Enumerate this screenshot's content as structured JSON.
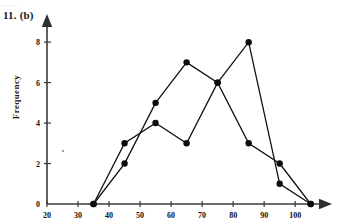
{
  "figure": {
    "problem_label": "11. (b)",
    "top_artifact_text": ". .  . .    .          .",
    "axis_label_y": "Frequency",
    "axis_label_x": ""
  },
  "chart_data": {
    "type": "line",
    "title": "",
    "xlabel": "",
    "ylabel": "Frequency",
    "xlim": [
      20,
      108
    ],
    "ylim": [
      0,
      8.6
    ],
    "xticks": [
      20,
      30,
      40,
      50,
      60,
      70,
      80,
      90,
      100
    ],
    "yticks": [
      0,
      2,
      4,
      6,
      8
    ],
    "xtick_labels": [
      "20",
      "30",
      "40",
      "50",
      "60",
      "70",
      "80",
      "90",
      "100"
    ],
    "ytick_labels": [
      "0",
      "2",
      "4",
      "6",
      "8"
    ],
    "grid": false,
    "legend": "none",
    "x": [
      35,
      45,
      55,
      65,
      75,
      85,
      95,
      105
    ],
    "series": [
      {
        "name": "Series A",
        "color": "#111111",
        "values": [
          0,
          3,
          4,
          3,
          6,
          8,
          1,
          0
        ]
      },
      {
        "name": "Series B",
        "color": "#111111",
        "values": [
          0,
          2,
          5,
          7,
          6,
          3,
          2,
          0
        ]
      }
    ],
    "annotations": []
  }
}
